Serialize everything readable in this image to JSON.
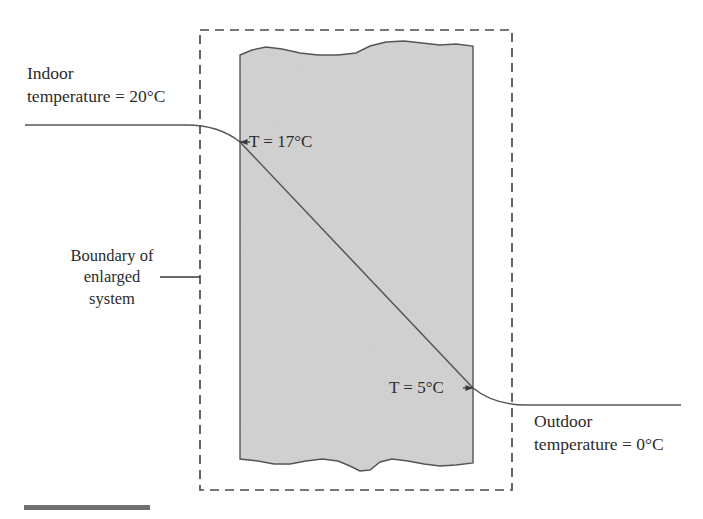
{
  "figure": {
    "background_color": "#ffffff",
    "width": 703,
    "height": 519
  },
  "annotations": {
    "indoor": {
      "line1": "Indoor",
      "line2": "temperature = 20°C",
      "value": "20°C"
    },
    "outdoor": {
      "line1": "Outdoor",
      "line2": "temperature = 0°C",
      "value": "0°C"
    },
    "boundary": {
      "line1": "Boundary of",
      "line2": "enlarged",
      "line3": "system"
    },
    "inner_surface": {
      "text": "T = 17°C",
      "value": "17°C"
    },
    "outer_surface": {
      "text": "T = 5°C",
      "value": "5°C"
    }
  },
  "wall": {
    "fill_color": "#d6d6d6",
    "edge_color": "#555555",
    "left_x": 240,
    "right_x": 473,
    "top_y": 48,
    "bottom_y": 463
  },
  "system_boundary": {
    "style": "dashed",
    "color": "#4a4a4a",
    "left_x": 200,
    "right_x": 512,
    "top_y": 30,
    "bottom_y": 490
  },
  "temperature_profile": {
    "color": "#555555",
    "indoor_level_y": 125,
    "inner_surface_point": [
      240,
      142
    ],
    "outer_surface_point": [
      473,
      388
    ],
    "outdoor_level_y": 405,
    "indoor_start_x": 25,
    "outdoor_end_x": 681
  },
  "artifact_bar": {
    "color": "#6f6f6f",
    "left_x": 24,
    "right_x": 150,
    "y": 508
  }
}
